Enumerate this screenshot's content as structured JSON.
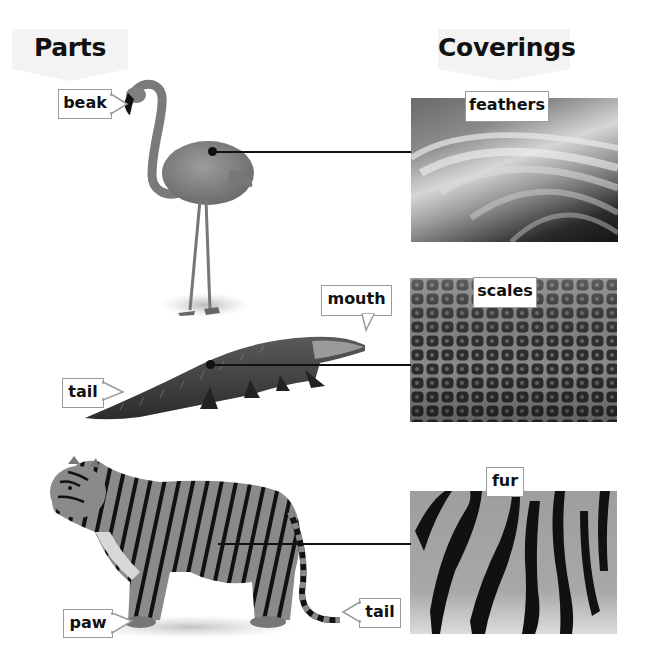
{
  "headers": {
    "parts": "Parts",
    "coverings": "Coverings"
  },
  "rows": [
    {
      "animal": "flamingo",
      "part_labels": [
        "beak"
      ],
      "covering_label": "feathers"
    },
    {
      "animal": "alligator",
      "part_labels": [
        "mouth",
        "tail"
      ],
      "covering_label": "scales"
    },
    {
      "animal": "tiger",
      "part_labels": [
        "paw",
        "tail"
      ],
      "covering_label": "fur"
    }
  ],
  "colors": {
    "banner": "#f3f3f3",
    "label_border": "#9a9a9a",
    "connector": "#111111"
  }
}
